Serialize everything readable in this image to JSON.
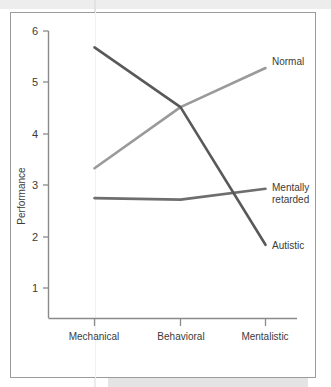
{
  "chart_data": {
    "type": "line",
    "title": "",
    "subtitle": "",
    "xlabel": "",
    "ylabel": "Performance",
    "categories": [
      "Mechanical",
      "Behavioral",
      "Mentalistic"
    ],
    "x": [
      1,
      2,
      3
    ],
    "ylim": [
      0,
      6
    ],
    "xtick_labels": [
      "Mechanical",
      "Behavioral",
      "Mentalistic"
    ],
    "ytick_labels": [
      "1",
      "2",
      "3",
      "4",
      "5",
      "6"
    ],
    "ytick_values": [
      1,
      2,
      3,
      4,
      5,
      6
    ],
    "grid": false,
    "legend_position": "right-inline-labels",
    "series": [
      {
        "name": "Normal",
        "values": [
          3.33,
          4.52,
          5.28
        ],
        "color": "#9a9a9a",
        "label": "Normal"
      },
      {
        "name": "Mentally retarded",
        "values": [
          2.75,
          2.72,
          2.93
        ],
        "color": "#6e6e6e",
        "label_line1": "Mentally",
        "label_line2": "retarded"
      },
      {
        "name": "Autistic",
        "values": [
          5.68,
          4.52,
          1.84
        ],
        "color": "#595959",
        "label": "Autistic"
      }
    ],
    "axis_color": "#8a8a8a",
    "text_color": "#3b3b3b",
    "background_color": "#ffffff",
    "frame_color": "#9b9b9b"
  }
}
